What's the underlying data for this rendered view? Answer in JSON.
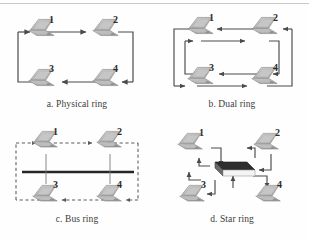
{
  "figure": {
    "type": "network-topology-diagram",
    "line_color": "#4a4a4a",
    "dash_color": "#5a5a5a",
    "hub_top_color": "#2e2e2e",
    "hub_face_color": "#ffffff",
    "laptop_body_color": "#b8b8b8",
    "laptop_screen_color": "#cfcfcf",
    "background": "#fefefe"
  },
  "panels": [
    {
      "id": "physical-ring",
      "caption": "a. Physical ring",
      "nodes": [
        {
          "label": "1",
          "x": 48,
          "y": 14
        },
        {
          "label": "2",
          "x": 112,
          "y": 14
        },
        {
          "label": "3",
          "x": 48,
          "y": 58
        },
        {
          "label": "4",
          "x": 112,
          "y": 58
        }
      ],
      "links": [
        {
          "from": "1",
          "to": "2",
          "direction": "right"
        },
        {
          "from": "2",
          "to": "4",
          "direction": "down"
        },
        {
          "from": "4",
          "to": "3",
          "direction": "left"
        },
        {
          "from": "3",
          "to": "1",
          "direction": "up"
        }
      ],
      "ring_count": 1
    },
    {
      "id": "dual-ring",
      "caption": "b. Dual ring",
      "nodes": [
        {
          "label": "1",
          "x": 46,
          "y": 12
        },
        {
          "label": "2",
          "x": 112,
          "y": 12
        },
        {
          "label": "3",
          "x": 46,
          "y": 58
        },
        {
          "label": "4",
          "x": 112,
          "y": 58
        }
      ],
      "links": [
        {
          "from": "1",
          "to": "2",
          "direction": "right",
          "ring": "inner"
        },
        {
          "from": "2",
          "to": "1",
          "direction": "left",
          "ring": "inner"
        },
        {
          "from": "3",
          "to": "4",
          "direction": "right",
          "ring": "outer"
        },
        {
          "from": "4",
          "to": "3",
          "direction": "left",
          "ring": "outer"
        }
      ],
      "ring_count": 2
    },
    {
      "id": "bus-ring",
      "caption": "c. Bus ring",
      "nodes": [
        {
          "label": "1",
          "x": 46,
          "y": 10
        },
        {
          "label": "2",
          "x": 112,
          "y": 10
        },
        {
          "label": "3",
          "x": 46,
          "y": 58
        },
        {
          "label": "4",
          "x": 112,
          "y": 58
        }
      ],
      "bus_bar": {
        "style": "solid",
        "orientation": "horizontal"
      },
      "ring_path": {
        "style": "dashed"
      },
      "ring_count": 1
    },
    {
      "id": "star-ring",
      "caption": "d. Star ring",
      "nodes": [
        {
          "label": "1",
          "x": 34,
          "y": 10
        },
        {
          "label": "2",
          "x": 112,
          "y": 10
        },
        {
          "label": "3",
          "x": 48,
          "y": 64
        },
        {
          "label": "4",
          "x": 120,
          "y": 64
        }
      ],
      "hub": {
        "name": "central-hub",
        "shape": "3d-box"
      },
      "ring_count": 1
    }
  ]
}
